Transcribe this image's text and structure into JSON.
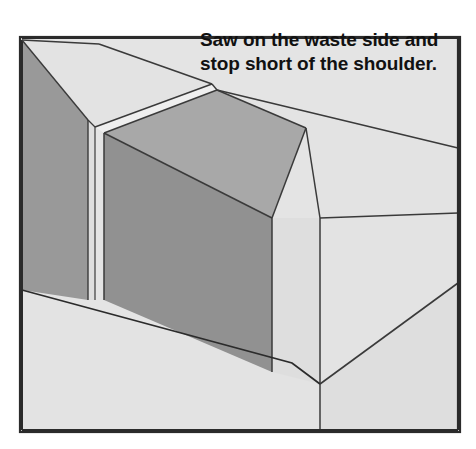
{
  "figure": {
    "name": "tenon-sawing-illustration",
    "frame": {
      "x": 20,
      "y": 37,
      "width": 440,
      "height": 395,
      "border_color": "#2b2b2b",
      "border_width": 2.2,
      "fill": "#e4e4e4"
    },
    "caption": {
      "line1": "Saw on the waste side and",
      "line2": "stop short of the shoulder.",
      "x": 200,
      "line1_y": 46,
      "line2_y": 70,
      "font_size": 19,
      "color": "#111111"
    },
    "palette": {
      "background": "#ffffff",
      "face_light": "#e3e3e3",
      "face_light_2": "#dedede",
      "face_medium": "#a8a8a8",
      "face_dark": "#999999",
      "face_dark_2": "#919191",
      "kerf_highlight": "#efefef",
      "outline": "#3a3a3a",
      "outline_strong": "#2b2b2b"
    },
    "surfaces": [
      {
        "id": "board-front-lower",
        "label": "board front face below shoulder",
        "tone": "face_light",
        "points": "22,290 22,430 458,430 458,283 320,384 292,363"
      },
      {
        "id": "board-right-end-lower",
        "label": "board right end grain lower",
        "tone": "face_light_2",
        "points": "320,384 458,283 458,430 320,430"
      },
      {
        "id": "tenon-left-cheek-dark",
        "label": "left outer cheek of waste piece",
        "tone": "face_dark",
        "points": "22,40 22,290 88,300 88,120"
      },
      {
        "id": "tenon-left-top",
        "label": "top face left of kerf",
        "tone": "face_light",
        "points": "22,40 88,120 95,127 212,84 99,44"
      },
      {
        "id": "waste-strip-front",
        "label": "thin waste strip front face",
        "tone": "face_light_2",
        "points": "88,120 95,127 95,300 88,300"
      },
      {
        "id": "kerf-slot",
        "label": "saw kerf slot",
        "tone": "kerf_highlight",
        "points": "95,127 212,84 217,90 104,133"
      },
      {
        "id": "kerf-slot-face",
        "label": "saw kerf inner face",
        "tone": "face_light_2",
        "points": "104,133 217,90 217,95 104,300"
      },
      {
        "id": "tenon-main-top",
        "label": "main piece top face",
        "tone": "face_medium",
        "points": "104,133 217,90 306,128 272,218"
      },
      {
        "id": "tenon-main-front",
        "label": "main piece front cheek face",
        "tone": "face_dark_2",
        "points": "104,133 272,218 272,372 104,300"
      },
      {
        "id": "board-top-right",
        "label": "board top face right of tenon",
        "tone": "face_light",
        "points": "217,90 458,148 458,213 320,218 306,128"
      },
      {
        "id": "board-right-upper",
        "label": "board right end upper",
        "tone": "face_light_2",
        "points": "272,218 320,218 320,384 272,372"
      },
      {
        "id": "board-end-far",
        "label": "far right end chamfer",
        "tone": "face_light",
        "points": "320,218 458,213 458,283 320,384"
      }
    ],
    "edges": [
      {
        "id": "frame-top",
        "d": "M22,38 L458,38",
        "width": 2.2,
        "tone": "outline_strong"
      },
      {
        "id": "tenon-left-vertical",
        "d": "M22,40 L22,430",
        "width": 2.0,
        "tone": "outline_strong"
      },
      {
        "id": "top-ridge-left",
        "d": "M22,40 L99,44",
        "width": 1.6,
        "tone": "outline"
      },
      {
        "id": "top-ridge-main",
        "d": "M99,44 L212,84",
        "width": 1.6,
        "tone": "outline"
      },
      {
        "id": "top-ridge-right",
        "d": "M217,90 L458,148",
        "width": 1.6,
        "tone": "outline"
      },
      {
        "id": "cheek-dark-edge",
        "d": "M22,40 L88,120",
        "width": 1.4,
        "tone": "outline"
      },
      {
        "id": "cheek-dark-bottom",
        "d": "M88,120 L88,300",
        "width": 1.4,
        "tone": "outline"
      },
      {
        "id": "waste-strip-edge",
        "d": "M95,127 L95,300",
        "width": 1.2,
        "tone": "outline"
      },
      {
        "id": "top-fold-left",
        "d": "M88,120 L95,127",
        "width": 1.2,
        "tone": "outline"
      },
      {
        "id": "kerf-upper-line",
        "d": "M95,127 L212,84",
        "width": 1.4,
        "tone": "outline"
      },
      {
        "id": "kerf-lower-line",
        "d": "M104,133 L217,90",
        "width": 1.4,
        "tone": "outline"
      },
      {
        "id": "kerf-stop-end",
        "d": "M212,84 L217,90",
        "width": 1.4,
        "tone": "outline"
      },
      {
        "id": "kerf-vertical",
        "d": "M104,133 L104,300",
        "width": 1.5,
        "tone": "outline"
      },
      {
        "id": "tenon-top-fold",
        "d": "M217,90 L306,128",
        "width": 1.5,
        "tone": "outline"
      },
      {
        "id": "tenon-top-front-fold",
        "d": "M104,133 L272,218",
        "width": 1.5,
        "tone": "outline"
      },
      {
        "id": "tenon-right-fold",
        "d": "M306,128 L272,218",
        "width": 1.5,
        "tone": "outline"
      },
      {
        "id": "tenon-right-vertical",
        "d": "M272,218 L272,372",
        "width": 1.5,
        "tone": "outline"
      },
      {
        "id": "board-corner-vertical",
        "d": "M320,218 L320,430",
        "width": 1.5,
        "tone": "outline"
      },
      {
        "id": "board-top-right-fold",
        "d": "M306,128 L320,218",
        "width": 1.5,
        "tone": "outline"
      },
      {
        "id": "board-far-fold",
        "d": "M320,218 L458,213",
        "width": 1.5,
        "tone": "outline"
      },
      {
        "id": "shoulder-line",
        "d": "M22,290 L292,363 L320,384",
        "width": 1.8,
        "tone": "outline_strong"
      },
      {
        "id": "bottom-bevel-right",
        "d": "M320,384 L458,283",
        "width": 1.6,
        "tone": "outline"
      },
      {
        "id": "frame-right",
        "d": "M458,38 L458,430",
        "width": 2.2,
        "tone": "outline_strong"
      },
      {
        "id": "frame-bottom",
        "d": "M22,430 L458,430",
        "width": 2.2,
        "tone": "outline_strong"
      }
    ]
  }
}
